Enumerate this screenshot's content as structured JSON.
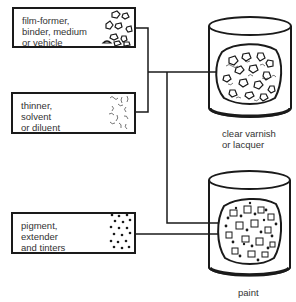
{
  "ingredients": [
    {
      "label": "film-former,\nbinder, medium\nor vehicle",
      "texture": "pebble-texture"
    },
    {
      "label": "thinner,\nsolvent\nor diluent",
      "texture": "squiggle-texture"
    },
    {
      "label": "pigment,\nextender\nand tinters",
      "texture": "dot-texture"
    }
  ],
  "products": [
    {
      "label": "clear varnish\nor lacquer",
      "inputs": [
        "film-former",
        "thinner"
      ]
    },
    {
      "label": "paint",
      "inputs": [
        "film-former",
        "thinner",
        "pigment"
      ]
    }
  ],
  "colors": {
    "line": "#1a1a1a",
    "text": "#333333",
    "background": "#ffffff"
  }
}
